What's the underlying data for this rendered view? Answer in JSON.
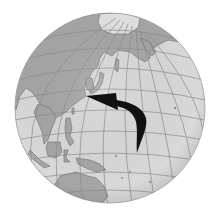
{
  "figure": {
    "regions_visible": [
      "Arctic",
      "Russia",
      "China",
      "Korea",
      "Japan",
      "Southeast Asia",
      "Philippines",
      "Indonesia",
      "New Guinea",
      "Australia",
      "Pacific Ocean"
    ],
    "arrow": {
      "description": "Curved typhoon-track arrow moving north then recurving west toward East Asia",
      "color": "#111111"
    }
  },
  "colors": {
    "background": "#ffffff",
    "ocean": "#d9d9d9",
    "land": "#a6a6a6",
    "arctic_ice": "#e2e2e2",
    "graticule": "#8c8c8c",
    "coastline": "#6e6e6e",
    "arrow": "#111111"
  },
  "geometry": {
    "cx": 110,
    "cy": 108,
    "r": 95
  }
}
